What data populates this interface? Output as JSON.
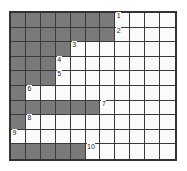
{
  "grid": {
    "columns": 11,
    "rows": 10,
    "fill_color": "#7a7a7a",
    "empty_color": "#fbfbfb",
    "line_color": "#3a3a3a",
    "row_fill_counts": [
      7,
      7,
      4,
      3,
      3,
      1,
      6,
      1,
      0,
      5
    ],
    "labels": [
      "1",
      "2",
      "3",
      "4",
      "5",
      "6",
      "7",
      "8",
      "9",
      "10"
    ]
  }
}
